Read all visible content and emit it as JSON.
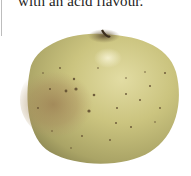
{
  "caption": {
    "text": "with an acid flavour."
  },
  "figure": {
    "colors": {
      "skin_base": "#c9c27a",
      "skin_light": "#ddd79a",
      "blush": "#a9875a",
      "shadow": "#8f8a55",
      "lenticel": "#5e4a2e",
      "stem": "#3b2e1e"
    }
  }
}
